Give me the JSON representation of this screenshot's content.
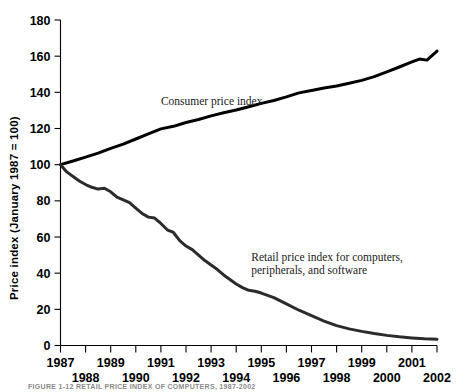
{
  "figure": {
    "background": "#ffffff",
    "ink_color": "#000000",
    "caption": "FIGURE 1-12   RETAIL PRICE INDEX OF COMPUTERS, 1987-2002"
  },
  "chart_data": {
    "type": "line",
    "title": "",
    "xlabel": "",
    "ylabel": "Price index (January 1987 = 100)",
    "xlim": [
      1987,
      2002
    ],
    "ylim": [
      0,
      180
    ],
    "grid": false,
    "legend": "inline-annotations",
    "yticks": [
      0,
      20,
      40,
      60,
      80,
      100,
      120,
      140,
      160,
      180
    ],
    "ytick_labels": [
      "0",
      "20",
      "40",
      "60",
      "80",
      "100",
      "120",
      "140",
      "160",
      "180"
    ],
    "xticks": [
      1987,
      1988,
      1989,
      1990,
      1991,
      1992,
      1993,
      1994,
      1995,
      1996,
      1997,
      1998,
      1999,
      2000,
      2001,
      2002
    ],
    "xtick_labels": [
      "1987",
      "1988",
      "1989",
      "1990",
      "1991",
      "1992",
      "1993",
      "1994",
      "1995",
      "1996",
      "1997",
      "1998",
      "1999",
      "2000",
      "2001",
      "2002"
    ],
    "xtick_label_rows": [
      0,
      1,
      0,
      1,
      0,
      1,
      0,
      1,
      0,
      1,
      0,
      1,
      0,
      1,
      0,
      1
    ],
    "series": [
      {
        "name": "Consumer price index",
        "color": "#000000",
        "width": 3.0,
        "x": [
          1987.0,
          1987.5,
          1988.0,
          1988.5,
          1989.0,
          1989.5,
          1990.0,
          1990.5,
          1991.0,
          1991.5,
          1992.0,
          1992.5,
          1993.0,
          1993.5,
          1994.0,
          1994.5,
          1995.0,
          1995.5,
          1996.0,
          1996.5,
          1997.0,
          1997.5,
          1998.0,
          1998.5,
          1999.0,
          1999.5,
          2000.0,
          2000.5,
          2001.0,
          2001.3,
          2001.6,
          2002.0
        ],
        "values": [
          100.0,
          102.0,
          104.2,
          106.4,
          109.0,
          111.4,
          114.2,
          117.0,
          119.8,
          121.2,
          123.3,
          125.0,
          127.0,
          128.7,
          130.2,
          132.0,
          133.9,
          135.5,
          137.5,
          139.7,
          141.0,
          142.4,
          143.5,
          145.0,
          146.6,
          148.7,
          151.3,
          154.0,
          156.8,
          158.4,
          157.8,
          162.8
        ]
      },
      {
        "name": "Retail price index for computers, peripherals, and software",
        "color": "#2b2b2b",
        "width": 3.0,
        "x": [
          1987.0,
          1987.25,
          1987.5,
          1987.75,
          1988.0,
          1988.25,
          1988.5,
          1988.75,
          1989.0,
          1989.25,
          1989.5,
          1989.75,
          1990.0,
          1990.25,
          1990.5,
          1990.75,
          1991.0,
          1991.25,
          1991.5,
          1991.75,
          1992.0,
          1992.25,
          1992.5,
          1992.75,
          1993.0,
          1993.25,
          1993.5,
          1993.75,
          1994.0,
          1994.25,
          1994.5,
          1994.75,
          1995.0,
          1995.5,
          1996.0,
          1996.5,
          1997.0,
          1997.5,
          1998.0,
          1998.5,
          1999.0,
          1999.5,
          2000.0,
          2000.5,
          2001.0,
          2001.5,
          2002.0
        ],
        "values": [
          100.0,
          96.0,
          93.5,
          91.0,
          89.0,
          87.5,
          86.5,
          87.0,
          85.0,
          82.0,
          80.5,
          79.0,
          76.0,
          73.0,
          71.0,
          70.5,
          67.5,
          64.0,
          62.5,
          58.0,
          55.0,
          53.0,
          50.0,
          47.0,
          44.5,
          42.0,
          39.0,
          36.5,
          34.0,
          32.0,
          30.5,
          30.0,
          29.0,
          26.5,
          23.0,
          19.5,
          16.5,
          13.5,
          11.0,
          9.2,
          7.8,
          6.6,
          5.6,
          4.8,
          4.2,
          3.7,
          3.4
        ]
      }
    ],
    "annotations": [
      {
        "name": "cpi-label",
        "lines": [
          "Consumer price index"
        ],
        "x": 1991.0,
        "y": 133
      },
      {
        "name": "retail-label",
        "lines": [
          "Retail price index for computers,",
          "peripherals, and software"
        ],
        "x": 1994.6,
        "y": 47
      }
    ]
  }
}
